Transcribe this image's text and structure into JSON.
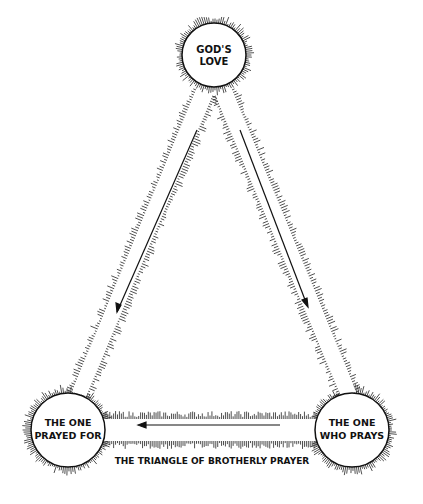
{
  "diagram": {
    "title": "THE TRIANGLE OF BROTHERLY PRAYER",
    "nodes": [
      {
        "id": "gods-love",
        "lines": [
          "GOD'S",
          "LOVE"
        ],
        "cx": 214,
        "cy": 55,
        "r": 32
      },
      {
        "id": "one-prayed-for",
        "lines": [
          "THE ONE",
          "PRAYED FOR"
        ],
        "cx": 68,
        "cy": 430,
        "r": 37
      },
      {
        "id": "one-who-prays",
        "lines": [
          "THE ONE",
          "WHO PRAYS"
        ],
        "cx": 352,
        "cy": 430,
        "r": 37
      }
    ],
    "edges": [
      {
        "from": "gods-love",
        "to": "one-prayed-for",
        "direction": "down-left"
      },
      {
        "from": "gods-love",
        "to": "one-who-prays",
        "direction": "down-right"
      },
      {
        "from": "one-who-prays",
        "to": "one-prayed-for",
        "direction": "left"
      }
    ],
    "colors": {
      "ink": "#111111",
      "background": "#ffffff"
    }
  }
}
